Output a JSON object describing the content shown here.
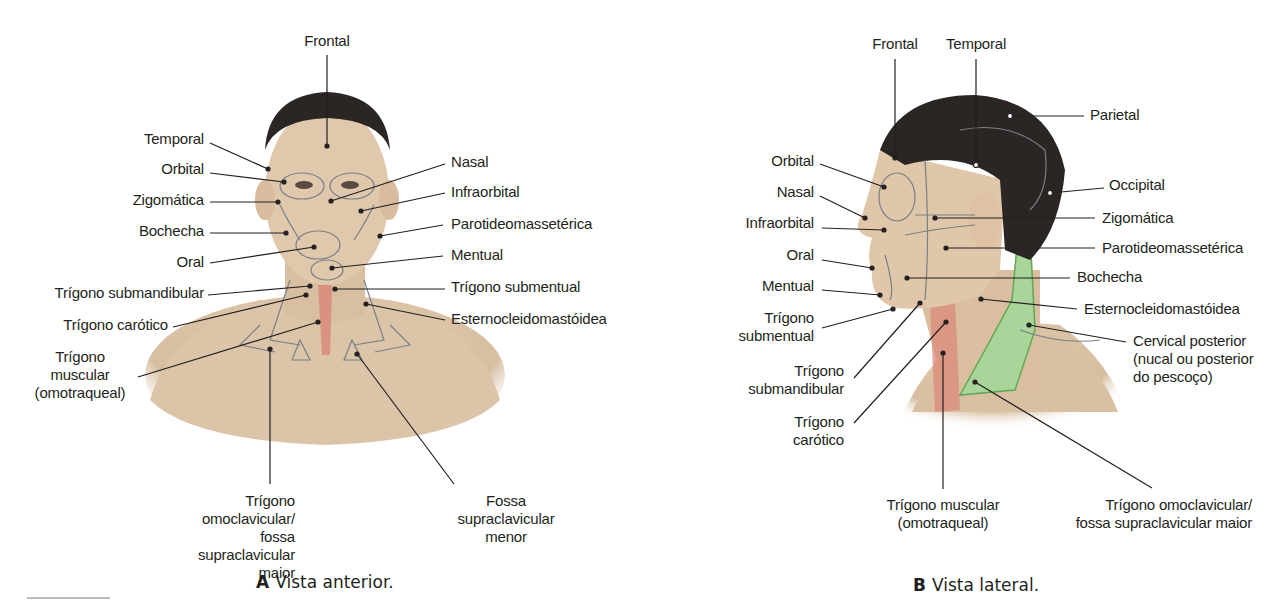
{
  "figure_a": {
    "caption_letter": "A",
    "caption_text": "Vista anterior.",
    "labels": {
      "frontal": "Frontal",
      "temporal": "Temporal",
      "orbital": "Orbital",
      "zigomatica": "Zigomática",
      "bochecha": "Bochecha",
      "oral": "Oral",
      "trigono_submandibular": "Trígono submandibular",
      "trigono_carotico": "Trígono carótico",
      "trigono_muscular": "Trígono\nmuscular\n(omotraqueal)",
      "nasal": "Nasal",
      "infraorbital": "Infraorbital",
      "parotideomasseterica": "Parotideomassetérica",
      "mentual": "Mentual",
      "trigono_submentual": "Trígono submentual",
      "esternocleidomastoidea": "Esternocleidomastóidea",
      "trigono_omoclavicular": "Trígono omoclavicular/\nfossa supraclavicular maior",
      "fossa_supraclavicular_menor": "Fossa\nsupraclavicular\nmenor"
    }
  },
  "figure_b": {
    "caption_letter": "B",
    "caption_text": "Vista lateral.",
    "labels": {
      "frontal": "Frontal",
      "temporal": "Temporal",
      "parietal": "Parietal",
      "orbital": "Orbital",
      "nasal": "Nasal",
      "infraorbital": "Infraorbital",
      "oral": "Oral",
      "mentual": "Mentual",
      "trigono_submentual": "Trígono\nsubmentual",
      "trigono_submandibular": "Trígono\nsubmandibular",
      "trigono_carotico": "Trígono\ncarótico",
      "occipital": "Occipital",
      "zigomatica": "Zigomática",
      "parotideomasseterica": "Parotideomassetérica",
      "bochecha": "Bochecha",
      "esternocleidomastoidea": "Esternocleidomastóidea",
      "cervical_posterior": "Cervical posterior\n(nucal ou posterior\ndo pescoço)",
      "trigono_muscular": "Trígono muscular\n(omotraqueal)",
      "trigono_omoclavicular": "Trígono omoclavicular/\nfossa supraclavicular maior"
    }
  },
  "colors": {
    "skin": "#e4cdb3",
    "hair": "#2b2624",
    "region_line": "#7a8088",
    "muscle_red": "#d98a7a",
    "posterior_green": "#a9d49a",
    "leader": "#231f20"
  }
}
